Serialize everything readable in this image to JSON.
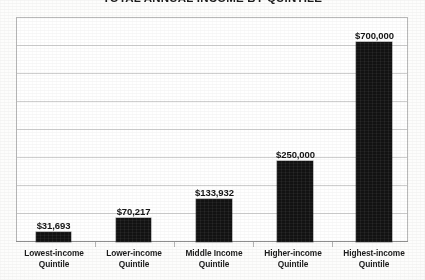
{
  "chart_data": {
    "type": "bar",
    "title": "TOTAL ANNUAL INCOME BY QUINTILE",
    "xlabel": "",
    "ylabel": "",
    "ylim": [
      0,
      770000
    ],
    "grid": true,
    "gridline_count": 7,
    "legend": "none",
    "categories": [
      "Lowest-income Quintile",
      "Lower-income Quintile",
      "Middle Income Quintile",
      "Higher-income Quintile",
      "Highest-income Quintile"
    ],
    "values": [
      31693,
      70217,
      133932,
      250000,
      700000
    ],
    "data_labels": [
      "$31,693",
      "$70,217",
      "$133,932",
      "$250,000",
      "$700,000"
    ],
    "bar_color": "#121212"
  },
  "chart": {
    "title": "TOTAL ANNUAL INCOME BY QUINTILE",
    "bars": [
      {
        "label_line1": "Lowest-income",
        "label_line2": "Quintile",
        "value_label": "$31,693",
        "value": 31693,
        "left": 36,
        "width": 35,
        "top": 232,
        "height": 10,
        "value_left": 16,
        "value_top": 220,
        "value_width": 75
      },
      {
        "label_line1": "Lower-income",
        "label_line2": "Quintile",
        "value_label": "$70,217",
        "value": 70217,
        "left": 116,
        "width": 35,
        "top": 218,
        "height": 24,
        "value_left": 96,
        "value_top": 206,
        "value_width": 75
      },
      {
        "label_line1": "Middle Income",
        "label_line2": "Quintile",
        "value_label": "$133,932",
        "value": 133932,
        "left": 196,
        "width": 36,
        "top": 199,
        "height": 43,
        "value_left": 176,
        "value_top": 187,
        "value_width": 77
      },
      {
        "label_line1": "Higher-income",
        "label_line2": "Quintile",
        "value_label": "$250,000",
        "value": 250000,
        "left": 277,
        "width": 36,
        "top": 161,
        "height": 81,
        "value_left": 257,
        "value_top": 149,
        "value_width": 77
      },
      {
        "label_line1": "Highest-income",
        "label_line2": "Quintile",
        "value_label": "$700,000",
        "value": 700000,
        "left": 356,
        "width": 36,
        "top": 42,
        "height": 200,
        "value_left": 336,
        "value_top": 30,
        "value_width": 77
      }
    ],
    "gridlines_top": [
      45,
      73,
      101,
      129,
      157,
      185,
      213
    ],
    "ticks_left": [
      95,
      174,
      253,
      332
    ],
    "category_label_slots": [
      {
        "left": 14,
        "width": 80
      },
      {
        "left": 94,
        "width": 80
      },
      {
        "left": 174,
        "width": 80
      },
      {
        "left": 253,
        "width": 80
      },
      {
        "left": 332,
        "width": 84
      }
    ]
  }
}
